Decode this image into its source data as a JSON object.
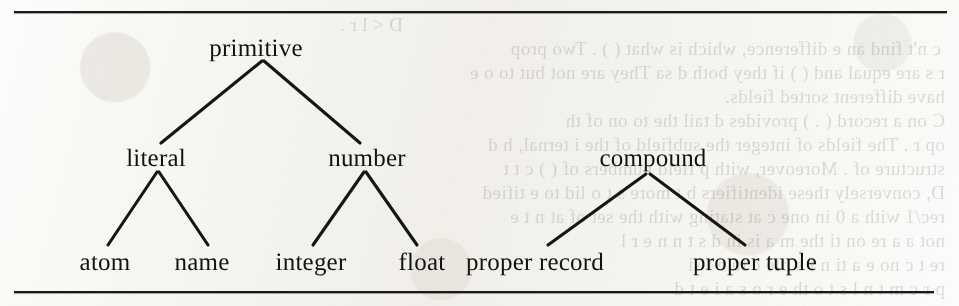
{
  "figure": {
    "kind": "type-hierarchy-tree",
    "ink_color": "#131210",
    "paper_color": "#fcfbf9",
    "rules": [
      {
        "name": "top-rule",
        "x": 14,
        "y": 11,
        "width": 933
      },
      {
        "name": "bottom-rule",
        "x": 14,
        "y": 291,
        "width": 920
      }
    ],
    "nodes": [
      {
        "id": "primitive",
        "label": "primitive",
        "x": 256,
        "y": 48,
        "level": 0
      },
      {
        "id": "literal",
        "label": "literal",
        "x": 156,
        "y": 158,
        "level": 1
      },
      {
        "id": "number",
        "label": "number",
        "x": 367,
        "y": 158,
        "level": 1
      },
      {
        "id": "compound",
        "label": "compound",
        "x": 653,
        "y": 158,
        "level": 1
      },
      {
        "id": "atom",
        "label": "atom",
        "x": 105,
        "y": 262,
        "level": 2
      },
      {
        "id": "name",
        "label": "name",
        "x": 202,
        "y": 262,
        "level": 2
      },
      {
        "id": "integer",
        "label": "integer",
        "x": 311,
        "y": 262,
        "level": 2
      },
      {
        "id": "float",
        "label": "float",
        "x": 422,
        "y": 262,
        "level": 2
      },
      {
        "id": "proper-record",
        "label": "proper record",
        "x": 535,
        "y": 262,
        "level": 2
      },
      {
        "id": "proper-tuple",
        "label": "proper tuple",
        "x": 755,
        "y": 262,
        "level": 2
      }
    ],
    "edges": [
      {
        "from": "primitive",
        "to": "literal",
        "x1": 262,
        "y1": 61,
        "x2": 161,
        "y2": 143
      },
      {
        "from": "primitive",
        "to": "number",
        "x1": 264,
        "y1": 61,
        "x2": 360,
        "y2": 143
      },
      {
        "from": "literal",
        "to": "atom",
        "x1": 157,
        "y1": 172,
        "x2": 108,
        "y2": 245
      },
      {
        "from": "literal",
        "to": "name",
        "x1": 159,
        "y1": 172,
        "x2": 208,
        "y2": 245
      },
      {
        "from": "number",
        "to": "integer",
        "x1": 364,
        "y1": 172,
        "x2": 313,
        "y2": 245
      },
      {
        "from": "number",
        "to": "float",
        "x1": 366,
        "y1": 172,
        "x2": 417,
        "y2": 245
      },
      {
        "from": "compound",
        "to": "proper record",
        "x1": 646,
        "y1": 174,
        "x2": 548,
        "y2": 245
      },
      {
        "from": "compound",
        "to": "proper tuple",
        "x1": 650,
        "y1": 174,
        "x2": 745,
        "y2": 245
      }
    ],
    "bleed_through": [
      {
        "text": "D <  l  r  .",
        "x": 556,
        "y": 14
      },
      {
        "text": "c  n't  find  an  e  difference, which is what (  )  . Two  prop",
        "x": 18,
        "y": 38
      },
      {
        "text": "r  s  are  equal  and  (  ) if  they  both  d    sa   They  are  not  but  to  o  e",
        "x": 14,
        "y": 62
      },
      {
        "text": "have  different  sorted  fields.",
        "x": 14,
        "y": 86
      },
      {
        "text": "C  on  a  record  (  .  ) provides  d  tail  the  to  on  of  th",
        "x": 14,
        "y": 110
      },
      {
        "text": "op  r  .  The  fields  of  integer     the  subfield  of  the  i  ternal,  h  d",
        "x": 14,
        "y": 134
      },
      {
        "text": "structure  of  .  Moreover,  with  p    field  numbers  of  (  ) c  t  t",
        "x": 14,
        "y": 158
      },
      {
        "text": "D,  conversely  these  identifiers  b  t  more  s  t  o  lid  to  e  tified",
        "x": 14,
        "y": 182
      },
      {
        "text": "rec/1  with  a  0  in  one  c  at   stating  with  the  set  of  at  n  t  e",
        "x": 14,
        "y": 206
      },
      {
        "text": "not  a  a  re  on  ti    the  m  a  is  in  d  s  t  n  n  e  r  l",
        "x": 14,
        "y": 230
      },
      {
        "text": "re  t  c  no  e  a  ti  n  f  s  ble  c  tu  e  t  si",
        "x": 14,
        "y": 254
      },
      {
        "text": "p  r  c  m  t  n  l  s  t  o  th  e  r  o  s  a  i  e  t  d",
        "x": 14,
        "y": 278
      }
    ]
  }
}
